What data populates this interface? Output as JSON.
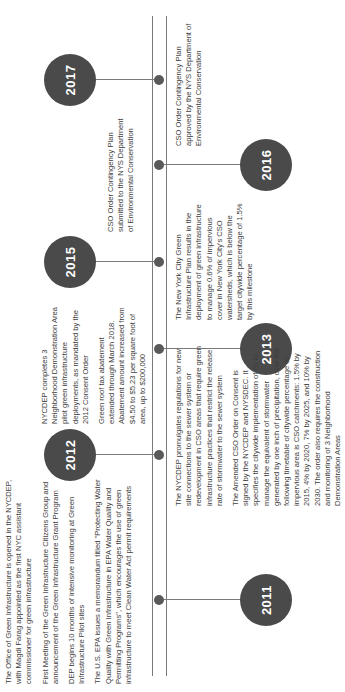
{
  "timeline": {
    "years": [
      "2011",
      "2012",
      "2013",
      "2015",
      "2016",
      "2017"
    ],
    "entries": {
      "e2011": [
        "The Office of Green Infrastructure is opened in the NYCDEP, with Magdi Farag appointed as the first NYC assistant commissioner for green infrastructure",
        "First Meeting of the Green Infrastructure Citizens Group and announcement of the Green Infrastructure Grant Program",
        "DEP begins 10 months of intensive monitoring at Green Infrastructure Pilot sites",
        "The U.S. EPA issues a memorandum titled \"Protecting Water Quality with Green Infrastructure in EPA Water Quality and Permitting Programs\", which encourages the use of green infrastructure to meet Clean Water Act permit requirements"
      ],
      "e2012": [
        "The NYCDEP  promulgates regulations for new site connections to the sewer system or redevelopment in CSO areas that require green infrastructure practices that restrict the release rate of stormwater to the sewer system",
        "The Amended CSO Order on Consent is signed by the NYCDEP and NYSDEC. It specifies the citywide implementation of GI to manage the equivalent of stormwater generated by one inch of precipitation, over the following timetable of citywide percentage of impervious area is CSO catchments: 1.5% by 2015, 4% by 2020, 7% by 2025, and 10% by 2030. The order also requires the construction and monitoring of 3 Neighborhood Demonstration Areas"
      ],
      "e2015": [
        "NYCDEP completes 3 Neighborhood Demonstration Area pilot green infrastructure deployments, as mandated by the 2012 Consent Order",
        "Green roof tax abatement extended through March 2018. Abatement amount increased from $4.50 to $5.23 per square foot of area, up to $200,000"
      ],
      "e2015b": [
        "The New York City Green Infrastructure Plan results in the deployment of green infrastructure to manage 0.6% of impervious cover in New York City's CSO watersheds, which is below the target citywide percentage of 1.5% by this milestone"
      ],
      "e2016": [
        "CSO Order Contingency Plan submitted to the NYS Department of Environmental Conservation"
      ],
      "e2017": [
        "CSO Order Contingency Plan approved by the NYS Department of Environmental Conservation"
      ]
    }
  },
  "colors": {
    "circle": "#4a4a4a",
    "line": "#7a7a7a",
    "text": "#3d3d3d"
  }
}
